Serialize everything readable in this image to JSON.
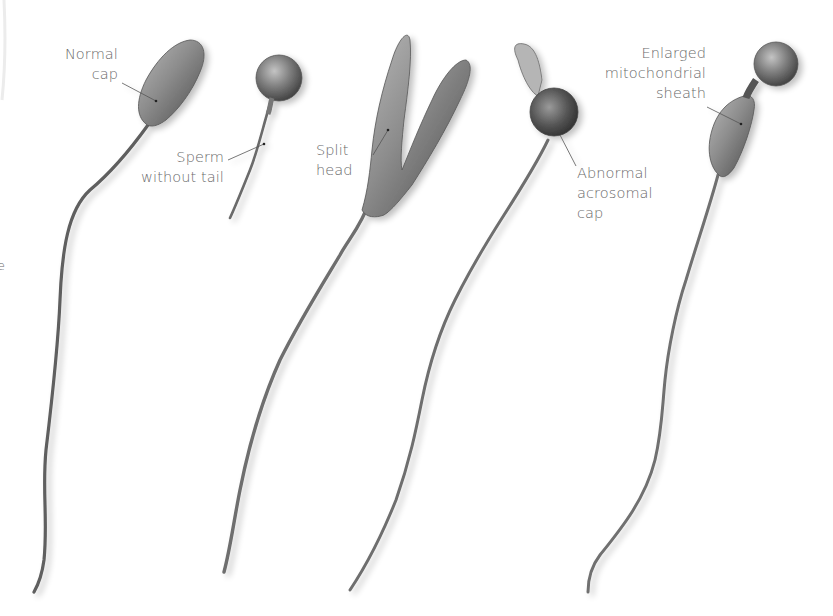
{
  "figure": {
    "background": "#ffffff",
    "label_color": "#6a6a6a",
    "specimens": [
      {
        "id": "normal",
        "label_lines": [
          "Normal",
          "cap"
        ],
        "shape": "elongated-head-with-long-tail"
      },
      {
        "id": "no-tail",
        "label_lines": [
          "Sperm",
          "without tail"
        ],
        "shape": "round-head-short-tail"
      },
      {
        "id": "split",
        "label_lines": [
          "Split",
          "head"
        ],
        "shape": "forked-double-head-with-tail"
      },
      {
        "id": "acrosomal",
        "label_lines": [
          "Abnormal",
          "acrosomal",
          "cap"
        ],
        "shape": "round-head-with-bulb-cap-and-tail"
      },
      {
        "id": "mito",
        "label_lines": [
          "Enlarged",
          "mitochondrial",
          "sheath"
        ],
        "shape": "round-head-swollen-midpiece-with-tail"
      }
    ],
    "edge_fragment": "e"
  }
}
